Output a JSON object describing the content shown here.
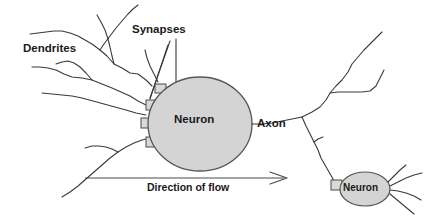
{
  "figure": {
    "type": "biological-diagram",
    "width": 429,
    "height": 221,
    "background_color": "#ffffff",
    "stroke_color": "#3a3a3a",
    "cell_fill_color": "#d4d4d4",
    "cell_stroke_color": "#555555"
  },
  "labels": {
    "dendrites": "Dendrites",
    "synapses": "Synapses",
    "neuron_main": "Neuron",
    "axon": "Axon",
    "direction_of_flow": "Direction of flow",
    "neuron_secondary": "Neuron"
  },
  "parts": {
    "soma_main": {
      "name": "Neuron cell body",
      "shape": "ellipse",
      "center_x": 200,
      "center_y": 124,
      "radius_x": 52,
      "radius_y": 47
    },
    "soma_secondary": {
      "name": "Neuron cell body",
      "shape": "ellipse",
      "center_x": 365,
      "center_y": 189,
      "radius_x": 25,
      "radius_y": 17
    },
    "synapse_boxes_count": 4,
    "dendrite_branches_count": 6,
    "axon_branches_count": 3
  },
  "arrow": {
    "name": "direction-of-flow-arrow",
    "from_x": 85,
    "from_y": 178,
    "to_x": 286,
    "to_y": 178,
    "direction": "right"
  }
}
